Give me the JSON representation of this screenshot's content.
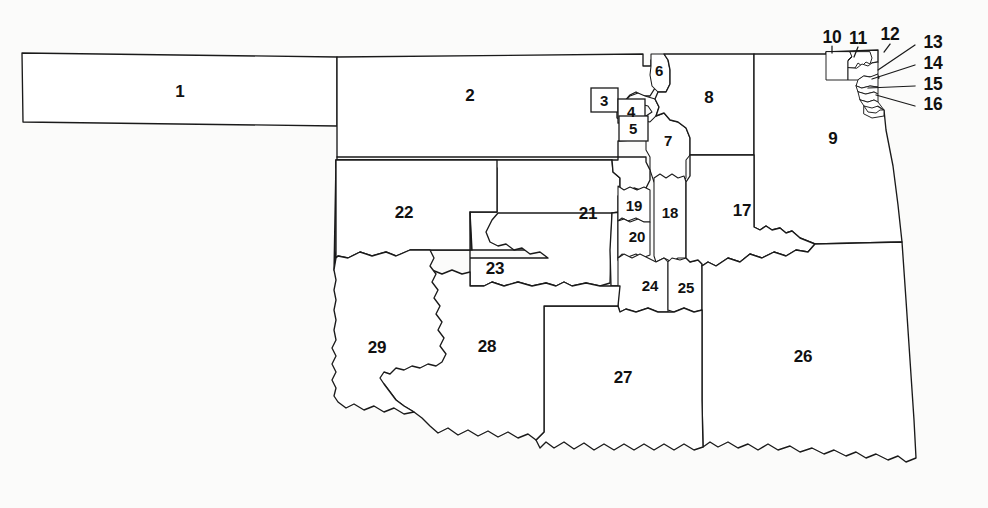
{
  "figure": {
    "kind": "region-map",
    "background_color": "#fbfbfa",
    "outline_color": "#1a1a1a",
    "fill_color": "#ffffff",
    "label_color": "#111111"
  },
  "regions": [
    {
      "id": "1",
      "label": "1",
      "x": 180,
      "y": 91,
      "style": "plain"
    },
    {
      "id": "2",
      "label": "2",
      "x": 470,
      "y": 95,
      "style": "plain"
    },
    {
      "id": "3",
      "label": "3",
      "x": 604,
      "y": 99,
      "style": "boxed"
    },
    {
      "id": "4",
      "label": "4",
      "x": 631,
      "y": 111,
      "style": "boxed"
    },
    {
      "id": "5",
      "label": "5",
      "x": 633,
      "y": 128,
      "style": "boxed"
    },
    {
      "id": "6",
      "label": "6",
      "x": 659,
      "y": 70,
      "style": "plain"
    },
    {
      "id": "7",
      "label": "7",
      "x": 668,
      "y": 140,
      "style": "plain"
    },
    {
      "id": "8",
      "label": "8",
      "x": 709,
      "y": 97,
      "style": "plain"
    },
    {
      "id": "9",
      "label": "9",
      "x": 833,
      "y": 138,
      "style": "plain"
    },
    {
      "id": "10",
      "label": "10",
      "x": 832,
      "y": 38,
      "style": "leader"
    },
    {
      "id": "11",
      "label": "11",
      "x": 858,
      "y": 39,
      "style": "leader"
    },
    {
      "id": "12",
      "label": "12",
      "x": 890,
      "y": 35,
      "style": "leader"
    },
    {
      "id": "13",
      "label": "13",
      "x": 933,
      "y": 43,
      "style": "leader"
    },
    {
      "id": "14",
      "label": "14",
      "x": 933,
      "y": 64,
      "style": "leader"
    },
    {
      "id": "15",
      "label": "15",
      "x": 933,
      "y": 85,
      "style": "leader"
    },
    {
      "id": "16",
      "label": "16",
      "x": 933,
      "y": 105,
      "style": "leader"
    },
    {
      "id": "17",
      "label": "17",
      "x": 742,
      "y": 210,
      "style": "plain"
    },
    {
      "id": "18",
      "label": "18",
      "x": 670,
      "y": 212,
      "style": "plain"
    },
    {
      "id": "19",
      "label": "19",
      "x": 634,
      "y": 205,
      "style": "plain"
    },
    {
      "id": "20",
      "label": "20",
      "x": 637,
      "y": 236,
      "style": "plain"
    },
    {
      "id": "21",
      "label": "21",
      "x": 588,
      "y": 213,
      "style": "plain"
    },
    {
      "id": "22",
      "label": "22",
      "x": 404,
      "y": 212,
      "style": "plain"
    },
    {
      "id": "23",
      "label": "23",
      "x": 495,
      "y": 268,
      "style": "plain"
    },
    {
      "id": "24",
      "label": "24",
      "x": 650,
      "y": 285,
      "style": "plain"
    },
    {
      "id": "25",
      "label": "25",
      "x": 686,
      "y": 287,
      "style": "plain"
    },
    {
      "id": "26",
      "label": "26",
      "x": 803,
      "y": 356,
      "style": "plain"
    },
    {
      "id": "27",
      "label": "27",
      "x": 623,
      "y": 377,
      "style": "plain"
    },
    {
      "id": "28",
      "label": "28",
      "x": 487,
      "y": 346,
      "style": "plain"
    },
    {
      "id": "29",
      "label": "29",
      "x": 377,
      "y": 347,
      "style": "plain"
    }
  ],
  "callout_boxes": [
    {
      "for": "3",
      "x": 591,
      "y": 88,
      "w": 27,
      "h": 24
    },
    {
      "for": "4",
      "x": 618,
      "y": 99,
      "w": 27,
      "h": 24
    },
    {
      "for": "5",
      "x": 619,
      "y": 116,
      "w": 29,
      "h": 25
    }
  ],
  "leader_lines": [
    {
      "for": "13",
      "d": "M 915 45 L 878 70"
    },
    {
      "for": "14",
      "d": "M 915 65 L 872 79"
    },
    {
      "for": "15",
      "d": "M 915 86 L 868 88"
    },
    {
      "for": "16",
      "d": "M 915 106 L 876 95"
    }
  ]
}
